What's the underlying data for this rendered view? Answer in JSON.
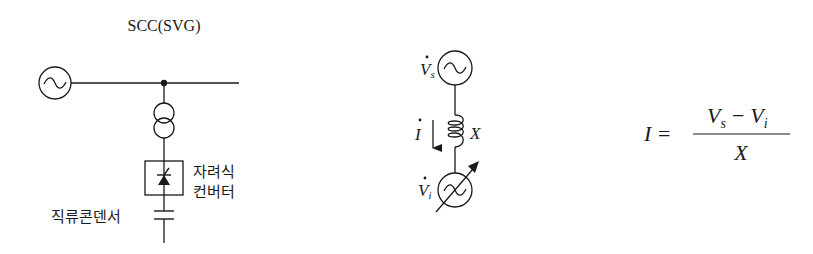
{
  "left_diagram": {
    "title": "SCC(SVG)",
    "converter_label_line1": "자려식",
    "converter_label_line2": "컨버터",
    "capacitor_label": "직류콘덴서"
  },
  "middle_diagram": {
    "source_voltage_symbol": "V",
    "source_voltage_subscript": "s",
    "current_symbol": "I",
    "reactance_symbol": "X",
    "inverter_voltage_symbol": "V",
    "inverter_voltage_subscript": "i"
  },
  "formula": {
    "lhs": "I",
    "equals": "=",
    "numerator_v1": "V",
    "numerator_sub1": "s",
    "minus": "−",
    "numerator_v2": "V",
    "numerator_sub2": "i",
    "denominator": "X"
  },
  "colors": {
    "stroke": "#1a1a1a",
    "background": "#ffffff"
  }
}
